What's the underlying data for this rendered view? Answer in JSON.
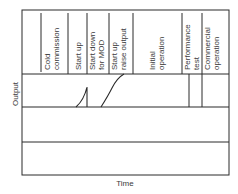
{
  "diagram": {
    "y_axis_label": "Output",
    "x_axis_label": "Time",
    "phases": [
      {
        "line1": "Cold",
        "line2": "commission"
      },
      {
        "line1": "Start up",
        "line2": ""
      },
      {
        "line1": "Start down",
        "line2": "for MOD"
      },
      {
        "line1": "Start up",
        "line2": "raise output"
      },
      {
        "line1": "Initial",
        "line2": "operation"
      },
      {
        "line1": "Performance",
        "line2": "test"
      },
      {
        "line1": "Commercial",
        "line2": "operation"
      }
    ],
    "colors": {
      "line": "#2a2a2a",
      "text": "#3a3a3a",
      "background": "#ffffff"
    }
  }
}
